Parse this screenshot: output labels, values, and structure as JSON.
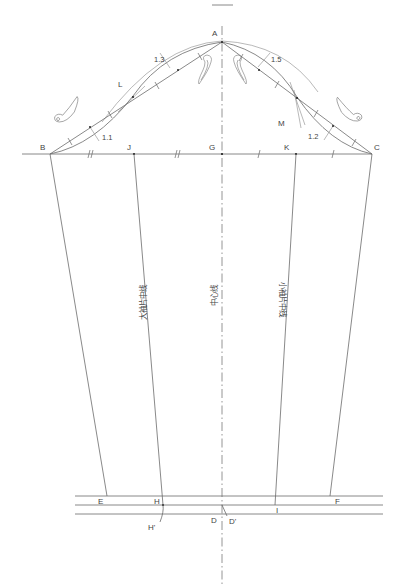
{
  "diagram": {
    "type": "sleeve-pattern-draft",
    "point_labels": {
      "A": "A",
      "B": "B",
      "C": "C",
      "D": "D",
      "D_prime": "D'",
      "E": "E",
      "F": "F",
      "G": "G",
      "H": "H",
      "H_prime": "H'",
      "I": "I",
      "J": "J",
      "K": "K",
      "L": "L",
      "M": "M"
    },
    "measurements": {
      "upper_left": "1.3",
      "upper_right": "1.5",
      "lower_left": "1.1",
      "lower_right": "1.2"
    },
    "line_labels": {
      "top_sleeve_center": "大袖片中线",
      "center_line": "中心线",
      "under_sleeve_center": "小袖片中线"
    },
    "colors": {
      "line": "#6b6b6b",
      "text": "#444444",
      "background": "#ffffff"
    }
  }
}
